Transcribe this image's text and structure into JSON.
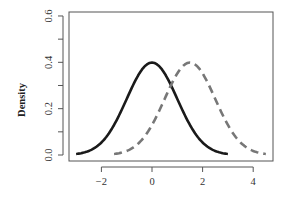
{
  "chart_data": {
    "type": "line",
    "title": "",
    "xlabel": "",
    "ylabel": "Density",
    "xlim": [
      -3.2,
      4.8
    ],
    "ylim": [
      -0.02,
      0.62
    ],
    "x_ticks": [
      -2,
      0,
      2,
      4
    ],
    "x_tick_labels": [
      "−2",
      "0",
      "2",
      "4"
    ],
    "y_ticks": [
      0.0,
      0.1,
      0.2,
      0.3,
      0.4,
      0.5,
      0.6
    ],
    "y_tick_labels": [
      "0.0",
      "",
      "0.2",
      "",
      "0.4",
      "",
      "0.6"
    ],
    "grid": false,
    "legend": null,
    "series": [
      {
        "name": "N(0,1) density",
        "style": "solid",
        "color": "#1a1a1a",
        "distribution": {
          "family": "normal",
          "mean": 0,
          "sd": 1
        },
        "x_range": [
          -3,
          3
        ],
        "peak": {
          "x": 0,
          "y": 0.399
        }
      },
      {
        "name": "N(1.5,1) density",
        "style": "dashed",
        "color": "#777777",
        "distribution": {
          "family": "normal",
          "mean": 1.5,
          "sd": 1
        },
        "x_range": [
          -1.5,
          4.5
        ],
        "peak": {
          "x": 1.5,
          "y": 0.399
        }
      }
    ]
  },
  "frame": {
    "left": 69,
    "right": 273,
    "top": 12,
    "bottom": 161,
    "x0_px": 152,
    "x_px_per_unit": 25.3,
    "y0_px": 155,
    "y_px_per_unit": 231.7
  }
}
